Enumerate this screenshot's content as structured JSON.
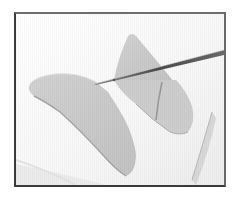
{
  "figure": {
    "colors": {
      "background": "#ffffff",
      "surface": "#fbfbfb",
      "clay": "#c9c9c9",
      "clay_shadow": "#a9a9a9",
      "clay_highlight": "#dcdcdc",
      "tool": "#5a5a5a",
      "frame": "#3a3a3a"
    },
    "objects": [
      {
        "name": "large-clay-piece",
        "position": "left-center"
      },
      {
        "name": "triangular-clay-piece",
        "position": "top-center"
      },
      {
        "name": "cut-clay-segment",
        "position": "center"
      },
      {
        "name": "needle-tool",
        "position": "upper-right diagonal"
      },
      {
        "name": "clay-sliver",
        "position": "lower-right"
      }
    ]
  }
}
